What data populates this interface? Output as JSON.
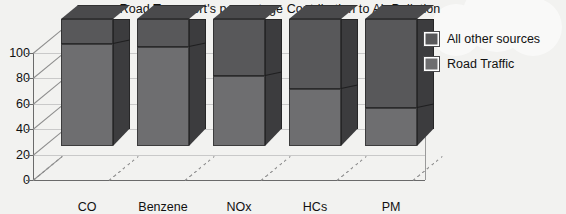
{
  "chart_data": {
    "type": "bar",
    "subtype": "stacked-3d-column",
    "title": "Road Transport's percentage Contribution to Air Pollution",
    "xlabel": "",
    "ylabel": "",
    "ylim": [
      0,
      100
    ],
    "yticks": [
      0,
      20,
      40,
      60,
      80,
      100
    ],
    "grid": true,
    "legend_position": "right",
    "categories": [
      "CO",
      "Benzene",
      "NOx",
      "HCs",
      "PM"
    ],
    "series": [
      {
        "name": "Road Traffic",
        "color": "#6e6e70",
        "values": [
          80,
          78,
          55,
          45,
          30
        ]
      },
      {
        "name": "All other sources",
        "color": "#58585a",
        "values": [
          20,
          22,
          45,
          55,
          70
        ]
      }
    ]
  },
  "legend": {
    "items": [
      {
        "label": "All other sources",
        "color": "#58585a"
      },
      {
        "label": "Road Traffic",
        "color": "#6e6e70"
      }
    ]
  }
}
